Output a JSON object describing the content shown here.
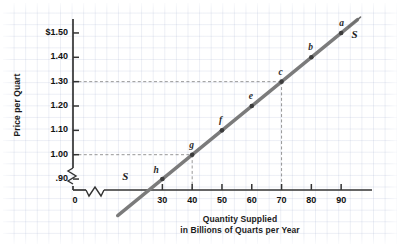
{
  "chart_data": {
    "type": "line",
    "title": "",
    "xlabel": "Quantity Supplied",
    "xlabel_line2": "in Billions of Quarts per Year",
    "ylabel": "Price per Quart",
    "xlim": [
      0,
      97
    ],
    "ylim": [
      0.855,
      1.545
    ],
    "x_ticks": [
      "0",
      "30",
      "40",
      "50",
      "60",
      "70",
      "80",
      "90"
    ],
    "x_tick_values": [
      0,
      30,
      40,
      50,
      60,
      70,
      80,
      90
    ],
    "y_ticks": [
      "$1.50",
      "1.40",
      "1.30",
      "1.20",
      "1.10",
      "1.00",
      ".90"
    ],
    "y_tick_values": [
      1.5,
      1.4,
      1.3,
      1.2,
      1.1,
      1.0,
      0.9
    ],
    "axis_break_x": true,
    "axis_break_y": true,
    "grid": true,
    "legend_position": "none",
    "series": [
      {
        "name": "S",
        "curve_label": "S",
        "curve_label_start": "S",
        "color": "#7b7b7b",
        "x": [
          30,
          40,
          50,
          60,
          70,
          80,
          90
        ],
        "values": [
          0.9,
          1.0,
          1.1,
          1.2,
          1.3,
          1.4,
          1.5
        ],
        "point_labels": [
          "h",
          "g",
          "f",
          "e",
          "c",
          "b",
          "a"
        ]
      }
    ],
    "guides": [
      {
        "label": "price-1.00-guide",
        "price": 1.0,
        "quantity": 40
      },
      {
        "label": "price-1.30-guide",
        "price": 1.3,
        "quantity": 70
      }
    ]
  }
}
